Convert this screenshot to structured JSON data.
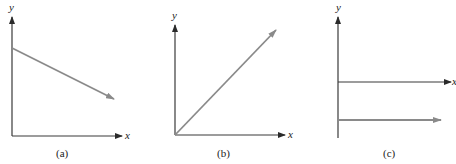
{
  "panels": [
    {
      "caption": "(a)",
      "x_label": "x",
      "y_label": "y",
      "description": "Straight line with negative slope starting at positive y-intercept"
    },
    {
      "caption": "(b)",
      "x_label": "x",
      "y_label": "y",
      "description": "Straight line with positive slope through the origin"
    },
    {
      "caption": "(c)",
      "x_label": "x",
      "y_label": "y",
      "description": "Horizontal line (zero slope) below the x-axis"
    }
  ],
  "colors": {
    "axis": "#3a3a3a",
    "line": "#8a8a8a"
  }
}
